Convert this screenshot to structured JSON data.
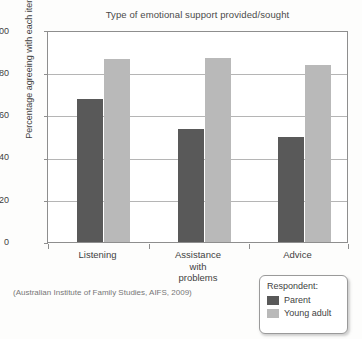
{
  "chart_data": {
    "type": "bar",
    "title": "Type of emotional support provided/sought",
    "xlabel": "",
    "ylabel": "Percentage agreeing with each item",
    "ylim": [
      0,
      100
    ],
    "yticks": [
      0,
      20,
      40,
      60,
      80,
      100
    ],
    "grid": true,
    "legend_position": "bottom-right",
    "legend_title": "Respondent:",
    "categories": [
      "Listening",
      "Assistance with problems",
      "Advice"
    ],
    "series": [
      {
        "name": "Parent",
        "color": "#595959",
        "values": [
          68,
          54,
          50
        ]
      },
      {
        "name": "Young adult",
        "color": "#b9b9b9",
        "values": [
          87,
          87.5,
          84.5
        ]
      }
    ],
    "source": "(Australian Institute of Family Studies, AIFS, 2009)"
  },
  "axis": {
    "ytick_labels": [
      "100",
      "80",
      "60",
      "40",
      "20",
      "0"
    ],
    "category_lines": [
      [
        "Listening"
      ],
      [
        "Assistance",
        "with",
        "problems"
      ],
      [
        "Advice"
      ]
    ]
  },
  "legend": {
    "title": "Respondent:",
    "items": [
      {
        "label": "Parent"
      },
      {
        "label": "Young adult"
      }
    ]
  },
  "colors": {
    "parent": "#595959",
    "young_adult": "#b9b9b9",
    "frame": "#8e8e8e",
    "grid": "#b5b5b5",
    "text": "#3f3f3f"
  }
}
